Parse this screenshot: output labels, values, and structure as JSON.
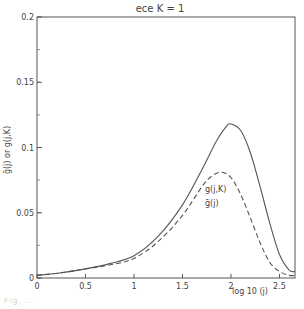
{
  "chart_data": {
    "type": "line",
    "title": "ece  K = 1",
    "xlabel": "log 10 (j)",
    "ylabel": "ḡ(j) or g(j,K)",
    "xlim": [
      0,
      2.66
    ],
    "ylim": [
      0,
      0.2
    ],
    "x_ticks": [
      0,
      0.5,
      1,
      1.5,
      2,
      2.5
    ],
    "x_tick_labels": [
      "0",
      "0.5",
      "1",
      "1.5",
      "2",
      "2.5"
    ],
    "y_ticks": [
      0,
      0.05,
      0.1,
      0.15,
      0.2
    ],
    "y_tick_labels": [
      "0",
      "0.05",
      "0.1",
      "0.15",
      "0.2"
    ],
    "grid": false,
    "legend": "inline annotations",
    "series": [
      {
        "name": "g(j,K)",
        "style": "solid",
        "x": [
          0,
          0.25,
          0.5,
          0.75,
          1.0,
          1.25,
          1.5,
          1.7,
          1.85,
          1.95,
          2.0,
          2.1,
          2.2,
          2.3,
          2.4,
          2.5,
          2.6,
          2.66
        ],
        "values": [
          0.002,
          0.004,
          0.007,
          0.011,
          0.017,
          0.032,
          0.056,
          0.083,
          0.105,
          0.116,
          0.118,
          0.113,
          0.096,
          0.07,
          0.042,
          0.018,
          0.006,
          0.005
        ]
      },
      {
        "name": "ḡ(j)",
        "style": "dashed",
        "x": [
          0,
          0.25,
          0.5,
          0.75,
          1.0,
          1.25,
          1.5,
          1.7,
          1.8,
          1.9,
          2.0,
          2.1,
          2.2,
          2.3,
          2.4,
          2.5,
          2.6,
          2.66
        ],
        "values": [
          0.002,
          0.004,
          0.007,
          0.01,
          0.015,
          0.028,
          0.048,
          0.07,
          0.078,
          0.081,
          0.077,
          0.064,
          0.046,
          0.027,
          0.012,
          0.005,
          0.002,
          0.002
        ]
      }
    ],
    "annotations": [
      {
        "text": "g(j,K)",
        "x": 1.82,
        "y": 0.09
      },
      {
        "text": "ḡ(j)",
        "x": 1.82,
        "y": 0.075
      }
    ]
  },
  "labels": {
    "title": "ece  K = 1",
    "xlabel": "log 10 (j)",
    "ylabel": "ḡ(j) or g(j,K)",
    "series_a": "g(j,K)",
    "series_b": "ḡ(j)",
    "caption": "Fig. ..."
  }
}
